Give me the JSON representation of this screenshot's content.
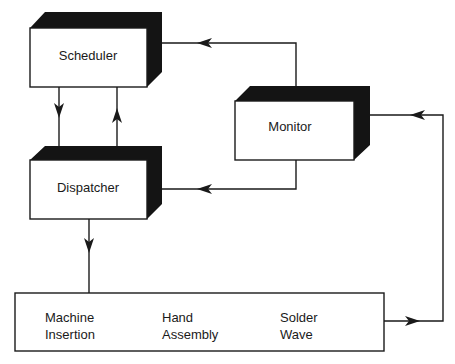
{
  "diagram": {
    "type": "block-flow",
    "nodes": [
      {
        "id": "scheduler",
        "label": "Scheduler",
        "style": "3d-box"
      },
      {
        "id": "dispatcher",
        "label": "Dispatcher",
        "style": "3d-box"
      },
      {
        "id": "monitor",
        "label": "Monitor",
        "style": "3d-box"
      },
      {
        "id": "shop_floor",
        "style": "flat-box",
        "stations": [
          {
            "line1": "Machine",
            "line2": "Insertion"
          },
          {
            "line1": "Hand",
            "line2": "Assembly"
          },
          {
            "line1": "Solder",
            "line2": "Wave"
          }
        ]
      }
    ],
    "edges": [
      {
        "from": "scheduler",
        "to": "dispatcher"
      },
      {
        "from": "dispatcher",
        "to": "scheduler"
      },
      {
        "from": "monitor",
        "to": "scheduler"
      },
      {
        "from": "monitor",
        "to": "dispatcher"
      },
      {
        "from": "dispatcher",
        "to": "shop_floor"
      },
      {
        "from": "shop_floor",
        "to": "monitor"
      }
    ],
    "colors": {
      "ink": "#1a1a1a",
      "shade": "#141414",
      "background": "#ffffff"
    }
  }
}
